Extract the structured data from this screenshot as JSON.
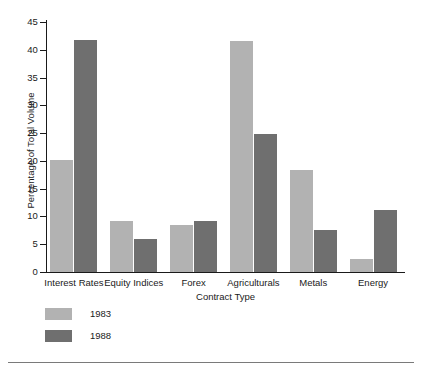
{
  "chart_data": {
    "type": "bar",
    "title": "",
    "xlabel": "Contract Type",
    "ylabel": "Percentage of Total Volume",
    "categories": [
      "Interest Rates",
      "Equity Indices",
      "Forex",
      "Agriculturals",
      "Metals",
      "Energy"
    ],
    "series": [
      {
        "name": "1983",
        "color": "#b2b2b2",
        "values": [
          20.2,
          9.2,
          8.5,
          41.5,
          18.4,
          2.3
        ]
      },
      {
        "name": "1988",
        "color": "#6f6f6f",
        "values": [
          41.8,
          6.0,
          9.2,
          24.8,
          7.6,
          11.1
        ]
      }
    ],
    "ylim": [
      0,
      45
    ],
    "yticks": [
      0,
      5,
      10,
      15,
      20,
      25,
      30,
      35,
      40,
      45
    ],
    "ytick_labels": [
      "0",
      "5",
      "10",
      "15",
      "20",
      "25",
      "30",
      "35",
      "40",
      "45"
    ],
    "grid": false,
    "legend_position": "below-left"
  }
}
